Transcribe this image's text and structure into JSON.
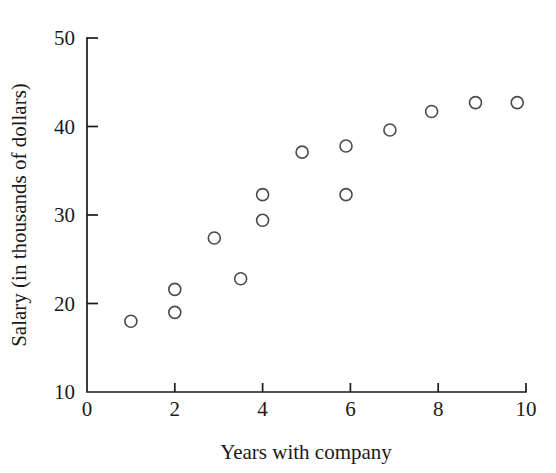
{
  "chart_data": {
    "type": "scatter",
    "title": "",
    "xlabel": "Years with company",
    "ylabel": "Salary (in thousands of dollars)",
    "xlim": [
      0,
      10
    ],
    "ylim": [
      10,
      50
    ],
    "xticks": [
      0,
      2,
      4,
      6,
      8,
      10
    ],
    "yticks": [
      10,
      20,
      30,
      40,
      50
    ],
    "xtick_labels": [
      "0",
      "2",
      "4",
      "6",
      "8",
      "10"
    ],
    "ytick_labels": [
      "10",
      "20",
      "30",
      "40",
      "50"
    ],
    "grid": false,
    "legend": null,
    "marker": {
      "shape": "open-circle",
      "radius": 6,
      "stroke_color": "#4a4a4a",
      "fill": "none"
    },
    "axis_color": "#1a1a1a",
    "background_color": "#ffffff",
    "points": [
      {
        "x": 1.0,
        "y": 18.0
      },
      {
        "x": 2.0,
        "y": 21.6
      },
      {
        "x": 2.0,
        "y": 19.0
      },
      {
        "x": 2.9,
        "y": 27.4
      },
      {
        "x": 3.5,
        "y": 22.8
      },
      {
        "x": 4.0,
        "y": 32.3
      },
      {
        "x": 4.0,
        "y": 29.4
      },
      {
        "x": 4.9,
        "y": 37.1
      },
      {
        "x": 5.9,
        "y": 37.8
      },
      {
        "x": 5.9,
        "y": 32.3
      },
      {
        "x": 6.9,
        "y": 39.6
      },
      {
        "x": 7.85,
        "y": 41.7
      },
      {
        "x": 8.85,
        "y": 42.7
      },
      {
        "x": 9.8,
        "y": 42.7
      }
    ]
  }
}
